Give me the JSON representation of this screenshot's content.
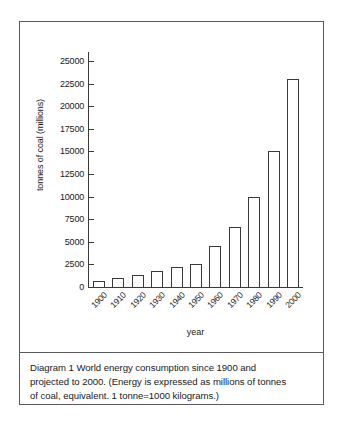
{
  "figure": {
    "caption_line1": "Diagram 1   World energy consumption since 1900 and",
    "caption_line2": "projected to 2000. (Energy is expressed as millions of tonnes",
    "caption_line3": "of coal, equivalent. 1 tonne=1000 kilograms.)",
    "border_color": "#5a5a5a"
  },
  "chart_data": {
    "type": "bar",
    "title": "",
    "subtitle": "",
    "xlabel": "year",
    "ylabel": "tonnes of coal (millions)",
    "categories": [
      "1900",
      "1910",
      "1920",
      "1930",
      "1940",
      "1950",
      "1960",
      "1970",
      "1980",
      "1990",
      "2000"
    ],
    "values": [
      700,
      1000,
      1300,
      1750,
      2200,
      2600,
      4500,
      6600,
      10000,
      15000,
      23000
    ],
    "ylim": [
      0,
      26000
    ],
    "yticks": [
      0,
      2500,
      5000,
      7500,
      10000,
      12500,
      15000,
      17500,
      20000,
      22500,
      25000
    ],
    "ytick_labels": [
      "0",
      "2500",
      "5000",
      "7500",
      "10000",
      "12500",
      "15000",
      "17500",
      "20000",
      "22500",
      "25000"
    ],
    "grid": false,
    "legend": false,
    "bar_fill": "#ffffff",
    "bar_edge": "#3a3a3a",
    "axis_color": "#3a3a3a"
  }
}
